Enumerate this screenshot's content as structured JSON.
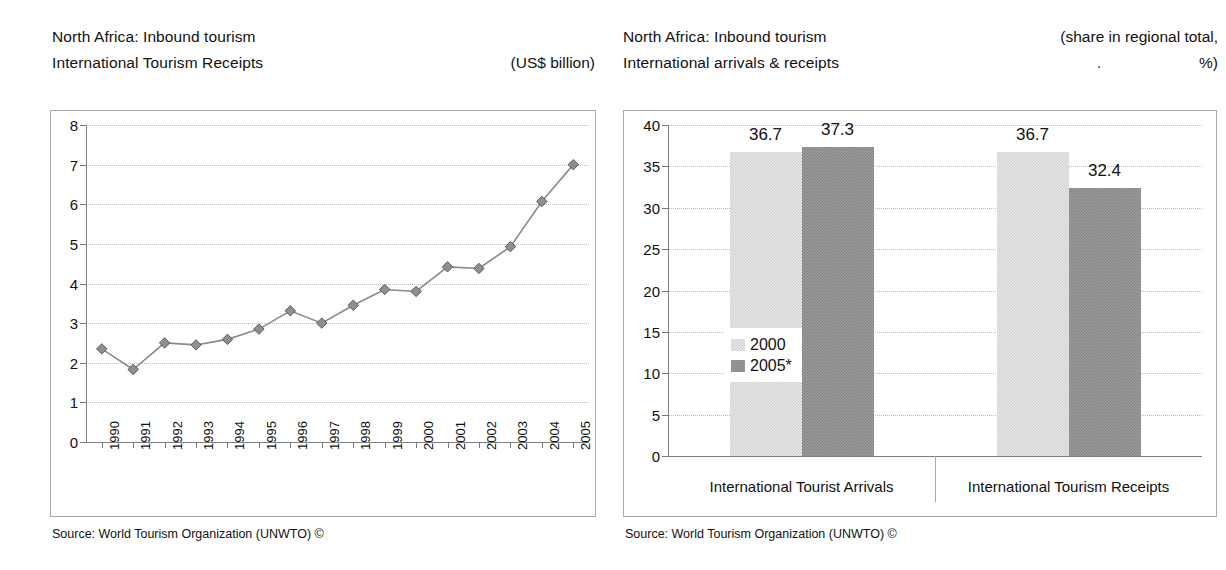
{
  "left": {
    "header": {
      "line1": "North Africa: Inbound tourism",
      "line2": "International Tourism Receipts",
      "unit": "(US$ billion)"
    },
    "source": "Source: World Tourism Organization (UNWTO) ©"
  },
  "right": {
    "header": {
      "line1": "North Africa: Inbound tourism",
      "line2": "International arrivals & receipts",
      "unit_line1": "(share in regional total,",
      "unit_line2": "%)"
    },
    "source": "Source: World Tourism Organization (UNWTO) ©"
  },
  "chart_data": [
    {
      "type": "line",
      "title": "North Africa: Inbound tourism – International Tourism Receipts",
      "xlabel": "",
      "ylabel": "",
      "unit": "(US$ billion)",
      "grid": true,
      "legend": "none",
      "ylim": [
        0,
        8
      ],
      "yticks": [
        0,
        1,
        2,
        3,
        4,
        5,
        6,
        7,
        8
      ],
      "ytick_labels": [
        "0",
        "1",
        "2",
        "3",
        "4",
        "5",
        "6",
        "7",
        "8"
      ],
      "categories": [
        "1990",
        "1991",
        "1992",
        "1993",
        "1994",
        "1995",
        "1996",
        "1997",
        "1998",
        "1999",
        "2000",
        "2001",
        "2002",
        "2003",
        "2004",
        "2005"
      ],
      "series": [
        {
          "name": "International Tourism Receipts",
          "marker": "diamond",
          "color": "#8a8a8a",
          "values": [
            2.35,
            1.83,
            2.5,
            2.45,
            2.59,
            2.85,
            3.31,
            3.0,
            3.45,
            3.85,
            3.8,
            4.42,
            4.38,
            4.93,
            6.07,
            7.0
          ]
        }
      ]
    },
    {
      "type": "bar",
      "title": "North Africa: Inbound tourism – International arrivals & receipts",
      "xlabel": "",
      "ylabel": "",
      "unit": "(share in regional total, %)",
      "grid": true,
      "legend": "inside-left",
      "ylim": [
        0,
        40
      ],
      "yticks": [
        0,
        5,
        10,
        15,
        20,
        25,
        30,
        35,
        40
      ],
      "ytick_labels": [
        "0",
        "5",
        "10",
        "15",
        "20",
        "25",
        "30",
        "35",
        "40"
      ],
      "categories": [
        "International Tourist Arrivals",
        "International Tourism Receipts"
      ],
      "series": [
        {
          "name": "2000",
          "color": "#e6e6e6",
          "values": [
            36.7,
            36.7
          ],
          "labels": [
            "36.7",
            "36.7"
          ]
        },
        {
          "name": "2005*",
          "color": "#9e9e9e",
          "values": [
            37.3,
            32.4
          ],
          "labels": [
            "37.3",
            "32.4"
          ]
        }
      ]
    }
  ]
}
